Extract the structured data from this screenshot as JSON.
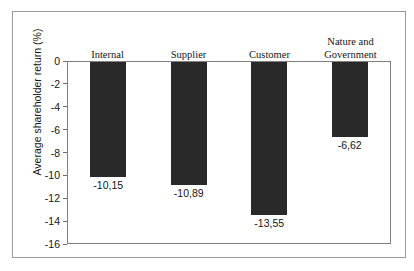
{
  "chart_data": {
    "type": "bar",
    "title": "",
    "subtitle": "",
    "xlabel": "",
    "ylabel": "Average shareholder return (%)",
    "categories": [
      "Internal",
      "Supplier",
      "Customer",
      "Nature and\nGovernment"
    ],
    "category_lines": [
      [
        "Internal"
      ],
      [
        "Supplier"
      ],
      [
        "Customer"
      ],
      [
        "Nature and",
        "Government"
      ]
    ],
    "values": [
      -10.15,
      -10.89,
      -13.55,
      -6.62
    ],
    "value_labels": [
      "-10,15",
      "-10,89",
      "-13,55",
      "-6,62"
    ],
    "ylim": [
      -16,
      0
    ],
    "yticks": [
      0,
      -2,
      -4,
      -6,
      -8,
      -10,
      -12,
      -14,
      -16
    ],
    "ytick_labels": [
      "0",
      "-2",
      "-4",
      "-6",
      "-8",
      "-10",
      "-12",
      "-14",
      "-16"
    ],
    "grid": false,
    "legend": false,
    "legend_position": "none",
    "bar_color": "#292929",
    "axis_color": "#808080",
    "text_color": "#141414",
    "category_label_position": "top",
    "value_label_position": "below-bar-end"
  }
}
